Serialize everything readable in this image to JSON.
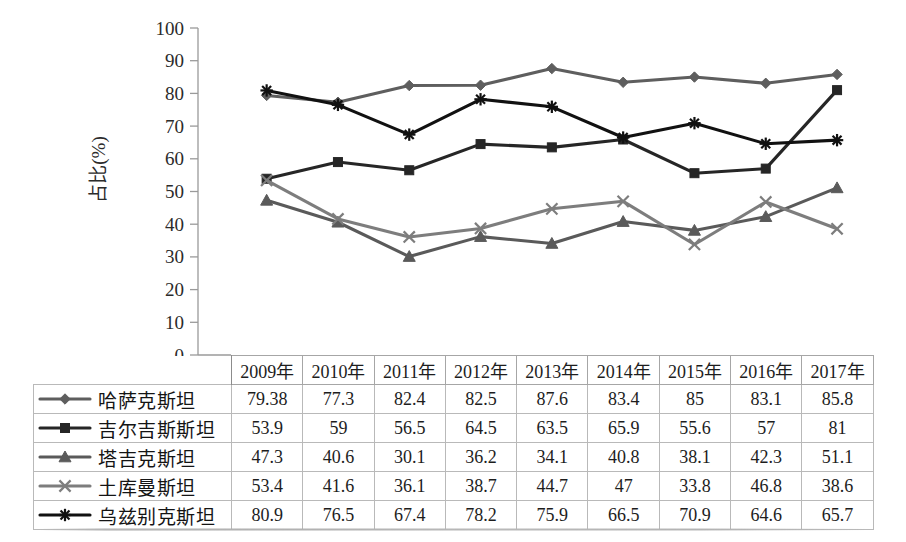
{
  "chart_data": {
    "type": "line",
    "title": "",
    "subtitle": "",
    "xlabel": "",
    "ylabel": "占比(%)",
    "ylim": [
      0,
      100
    ],
    "ytick_step": 10,
    "yticks": [
      "0",
      "10",
      "20",
      "30",
      "40",
      "50",
      "60",
      "70",
      "80",
      "90",
      "100"
    ],
    "grid": false,
    "legend_position": "table-left-column",
    "categories": [
      "2009年",
      "2010年",
      "2011年",
      "2012年",
      "2013年",
      "2014年",
      "2015年",
      "2016年",
      "2017年"
    ],
    "series": [
      {
        "name": "哈萨克斯坦",
        "marker": "diamond",
        "color": "#5e5e5e",
        "values": [
          79.38,
          77.3,
          82.4,
          82.5,
          87.6,
          83.4,
          85,
          83.1,
          85.8
        ],
        "labels": [
          "79.38",
          "77.3",
          "82.4",
          "82.5",
          "87.6",
          "83.4",
          "85",
          "83.1",
          "85.8"
        ]
      },
      {
        "name": "吉尔吉斯斯坦",
        "marker": "square",
        "color": "#262626",
        "values": [
          53.9,
          59,
          56.5,
          64.5,
          63.5,
          65.9,
          55.6,
          57,
          81
        ],
        "labels": [
          "53.9",
          "59",
          "56.5",
          "64.5",
          "63.5",
          "65.9",
          "55.6",
          "57",
          "81"
        ]
      },
      {
        "name": "塔吉克斯坦",
        "marker": "triangle",
        "color": "#5a5a5a",
        "values": [
          47.3,
          40.6,
          30.1,
          36.2,
          34.1,
          40.8,
          38.1,
          42.3,
          51.1
        ],
        "labels": [
          "47.3",
          "40.6",
          "30.1",
          "36.2",
          "34.1",
          "40.8",
          "38.1",
          "42.3",
          "51.1"
        ]
      },
      {
        "name": "土库曼斯坦",
        "marker": "x",
        "color": "#7d7d7d",
        "values": [
          53.4,
          41.6,
          36.1,
          38.7,
          44.7,
          47,
          33.8,
          46.8,
          38.6
        ],
        "labels": [
          "53.4",
          "41.6",
          "36.1",
          "38.7",
          "44.7",
          "47",
          "33.8",
          "46.8",
          "38.6"
        ]
      },
      {
        "name": "乌兹别克斯坦",
        "marker": "star",
        "color": "#111111",
        "values": [
          80.9,
          76.5,
          67.4,
          78.2,
          75.9,
          66.5,
          70.9,
          64.6,
          65.7
        ],
        "labels": [
          "80.9",
          "76.5",
          "67.4",
          "78.2",
          "75.9",
          "66.5",
          "70.9",
          "64.6",
          "65.7"
        ]
      }
    ]
  },
  "table": {
    "corner_label": "",
    "column_headers": [
      "2009年",
      "2010年",
      "2011年",
      "2012年",
      "2013年",
      "2014年",
      "2015年",
      "2016年",
      "2017年"
    ],
    "rows": [
      {
        "label": "哈萨克斯坦",
        "values": [
          "79.38",
          "77.3",
          "82.4",
          "82.5",
          "87.6",
          "83.4",
          "85",
          "83.1",
          "85.8"
        ]
      },
      {
        "label": "吉尔吉斯斯坦",
        "values": [
          "53.9",
          "59",
          "56.5",
          "64.5",
          "63.5",
          "65.9",
          "55.6",
          "57",
          "81"
        ]
      },
      {
        "label": "塔吉克斯坦",
        "values": [
          "47.3",
          "40.6",
          "30.1",
          "36.2",
          "34.1",
          "40.8",
          "38.1",
          "42.3",
          "51.1"
        ]
      },
      {
        "label": "土库曼斯坦",
        "values": [
          "53.4",
          "41.6",
          "36.1",
          "38.7",
          "44.7",
          "47",
          "33.8",
          "46.8",
          "38.6"
        ]
      },
      {
        "label": "乌兹别克斯坦",
        "values": [
          "80.9",
          "76.5",
          "67.4",
          "78.2",
          "75.9",
          "66.5",
          "70.9",
          "64.6",
          "65.7"
        ]
      }
    ]
  },
  "axis": {
    "y_title": "占比(%)"
  }
}
